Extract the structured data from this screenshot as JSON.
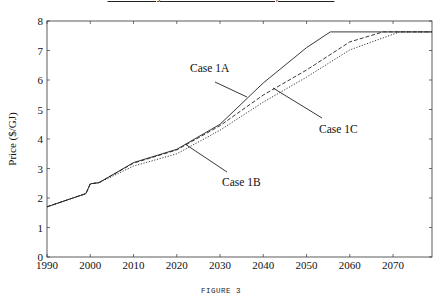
{
  "title": "Price Trajectories for Cases 1A, 1B and 1C",
  "caption": "FIGURE 3",
  "chart_data": {
    "type": "line",
    "title": "Price Trajectories for Cases 1A, 1B and 1C",
    "xlabel": "",
    "ylabel": "Price ($/GJ)",
    "xlim": [
      1990,
      2079
    ],
    "ylim": [
      0,
      8
    ],
    "xticks": [
      1990,
      2000,
      2010,
      2020,
      2030,
      2040,
      2050,
      2060,
      2070
    ],
    "yticks": [
      0,
      1,
      2,
      3,
      4,
      5,
      6,
      7,
      8
    ],
    "grid": false,
    "legend": "inline annotations with leader lines",
    "series": [
      {
        "name": "Case 1A",
        "style": "solid",
        "x": [
          1990,
          1999,
          2000,
          2002,
          2010,
          2020,
          2030,
          2040,
          2050,
          2055.5,
          2079
        ],
        "y": [
          1.7,
          2.15,
          2.48,
          2.52,
          3.2,
          3.65,
          4.5,
          5.9,
          7.1,
          7.63,
          7.63
        ]
      },
      {
        "name": "Case 1B",
        "style": "dotted",
        "x": [
          1990,
          1999,
          2000,
          2002,
          2010,
          2020,
          2030,
          2040,
          2050,
          2060,
          2071.5,
          2079
        ],
        "y": [
          1.7,
          2.15,
          2.48,
          2.52,
          3.08,
          3.5,
          4.3,
          5.25,
          6.1,
          7.02,
          7.63,
          7.63
        ]
      },
      {
        "name": "Case 1C",
        "style": "dashed",
        "x": [
          1990,
          1999,
          2000,
          2002,
          2010,
          2020,
          2030,
          2040,
          2050,
          2060,
          2067.7,
          2079
        ],
        "y": [
          1.7,
          2.15,
          2.48,
          2.52,
          3.18,
          3.63,
          4.45,
          5.49,
          6.34,
          7.29,
          7.63,
          7.63
        ]
      }
    ],
    "annotations": [
      {
        "text": "Case 1A",
        "points_to": "Case 1A"
      },
      {
        "text": "Case 1B",
        "points_to": "Case 1B"
      },
      {
        "text": "Case 1C",
        "points_to": "Case 1C"
      }
    ]
  },
  "labels": {
    "case_1a": "Case 1A",
    "case_1b": "Case 1B",
    "case_1c": "Case 1C"
  }
}
